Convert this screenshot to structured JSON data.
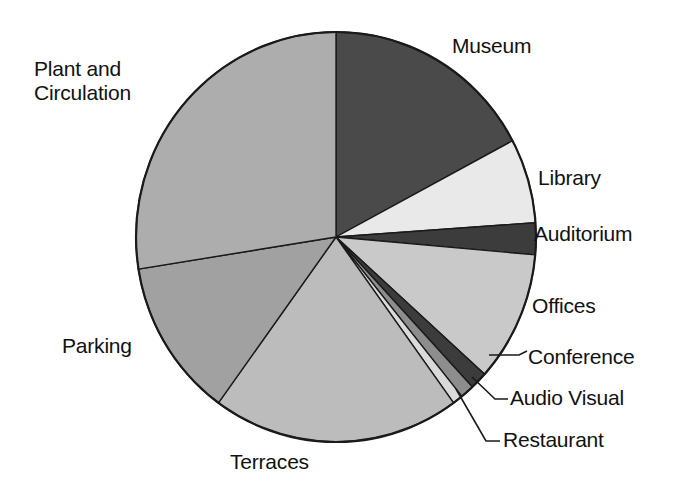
{
  "chart_data": {
    "type": "pie",
    "title": "",
    "subtitle": "",
    "xlabel": "",
    "ylabel": "",
    "legend_position": "none",
    "grid": false,
    "labels_placement": "outside-with-leader-lines",
    "units": "percent of total area",
    "categories": [
      "Museum",
      "Library",
      "Auditorium",
      "Offices",
      "Conference",
      "Audio Visual",
      "Restaurant",
      "Terraces",
      "Parking",
      "Plant and Circulation"
    ],
    "values": [
      17.2,
      6.7,
      2.5,
      10.3,
      1.4,
      1.1,
      0.8,
      20.0,
      12.5,
      27.5
    ],
    "slices": [
      {
        "label": "Museum",
        "value": 17.2,
        "start_angle": 0,
        "end_angle": 62,
        "color": "#4a4a4a"
      },
      {
        "label": "Library",
        "value": 6.7,
        "start_angle": 62,
        "end_angle": 86,
        "color": "#e9e9e9"
      },
      {
        "label": "Auditorium",
        "value": 2.5,
        "start_angle": 86,
        "end_angle": 95,
        "color": "#3c3c3c"
      },
      {
        "label": "Offices",
        "value": 10.3,
        "start_angle": 95,
        "end_angle": 132,
        "color": "#c9c9c9"
      },
      {
        "label": "Conference",
        "value": 1.4,
        "start_angle": 132,
        "end_angle": 137,
        "color": "#3c3c3c"
      },
      {
        "label": "Audio Visual",
        "value": 1.1,
        "start_angle": 137,
        "end_angle": 141,
        "color": "#8d8d8d"
      },
      {
        "label": "Restaurant",
        "value": 0.8,
        "start_angle": 141,
        "end_angle": 144,
        "color": "#dadada"
      },
      {
        "label": "Terraces",
        "value": 20.0,
        "start_angle": 144,
        "end_angle": 216,
        "color": "#bcbcbc"
      },
      {
        "label": "Parking",
        "value": 12.5,
        "start_angle": 216,
        "end_angle": 261,
        "color": "#a1a1a1"
      },
      {
        "label": "Plant and Circulation",
        "value": 27.5,
        "start_angle": 261,
        "end_angle": 360,
        "color": "#adadad"
      }
    ]
  },
  "labels": {
    "museum": "Museum",
    "library": "Library",
    "auditorium": "Auditorium",
    "offices": "Offices",
    "conference": "Conference",
    "audio_visual": "Audio Visual",
    "restaurant": "Restaurant",
    "terraces": "Terraces",
    "parking": "Parking",
    "plant_line1": "Plant and",
    "plant_line2": "Circulation"
  },
  "style": {
    "background": "#ffffff",
    "outline": "#1a1a1a",
    "text": "#111111",
    "leader_line": "#1a1a1a"
  },
  "geometry": {
    "center_x": 336,
    "center_y": 237,
    "radius_x": 200,
    "radius_y": 205
  }
}
